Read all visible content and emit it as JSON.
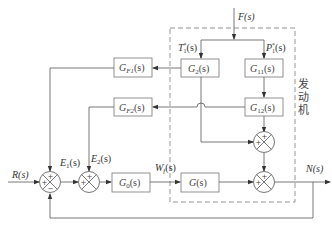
{
  "diagram": {
    "signals": {
      "F": "F(s)",
      "T1": "T",
      "T1_sup": "*",
      "T1_sub": "1",
      "T1_tail": "(s)",
      "P1": "P",
      "P1_sup": "*",
      "P1_sub": "1",
      "P1_tail": "(s)",
      "R": "R(s)",
      "E1": "E",
      "E1_sub": "1",
      "E1_tail": "(s)",
      "E2": "E",
      "E2_sub": "2",
      "E2_tail": "(s)",
      "Wf": "W",
      "Wf_sub": "f",
      "Wf_tail": "(s)",
      "N": "N(s)"
    },
    "blocks": {
      "G2": {
        "main": "G",
        "sub": "2",
        "tail": "(s)"
      },
      "G11": {
        "main": "G",
        "sub": "11",
        "tail": "(s)"
      },
      "G12": {
        "main": "G",
        "sub": "12",
        "tail": "(s)"
      },
      "GF1": {
        "main": "G",
        "sub": "F1",
        "tail": "(s)"
      },
      "GF2": {
        "main": "G",
        "sub": "F2",
        "tail": "(s)"
      },
      "G0": {
        "main": "G",
        "sub": "0",
        "tail": "(s)"
      },
      "G": {
        "main": "G",
        "tail": "(s)"
      }
    },
    "engine_label": [
      "发",
      "动",
      "机"
    ],
    "signs": {
      "plus": "+",
      "minus": "−"
    },
    "colors": {
      "line": "#555555",
      "box": "#777777",
      "dashed": "#888888"
    }
  }
}
